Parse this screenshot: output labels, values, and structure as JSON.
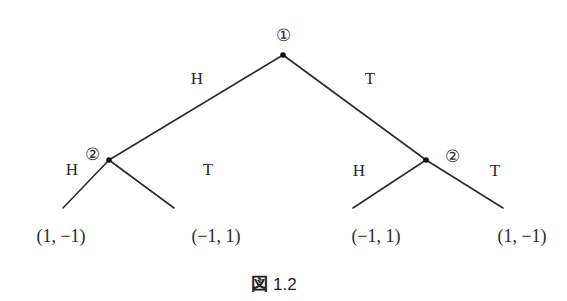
{
  "diagram": {
    "type": "game-tree",
    "caption": {
      "prefix": "図",
      "number": "1.2"
    },
    "colors": {
      "line": "#2b2b2b",
      "text": "#2a2a2a",
      "background": "#ffffff"
    },
    "nodes": [
      {
        "id": "root",
        "player_label": "①",
        "x": 283,
        "y": 55
      },
      {
        "id": "left",
        "player_label": "②",
        "x": 109,
        "y": 160
      },
      {
        "id": "right",
        "player_label": "②",
        "x": 426,
        "y": 160
      }
    ],
    "edges": [
      {
        "from": "root",
        "to": "left",
        "label": "H"
      },
      {
        "from": "root",
        "to": "right",
        "label": "T"
      },
      {
        "from": "left",
        "to": "leaf1",
        "label": "H"
      },
      {
        "from": "left",
        "to": "leaf2",
        "label": "T"
      },
      {
        "from": "right",
        "to": "leaf3",
        "label": "H"
      },
      {
        "from": "right",
        "to": "leaf4",
        "label": "T"
      }
    ],
    "payoffs": [
      "(1, −1)",
      "(−1, 1)",
      "(−1, 1)",
      "(1, −1)"
    ]
  }
}
